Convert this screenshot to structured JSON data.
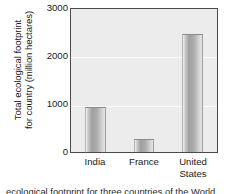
{
  "chart_data": {
    "type": "bar",
    "title": "",
    "xlabel": "",
    "ylabel": "Total ecological footprint for country (million hectares)",
    "ylabel_lines": [
      "Total ecological footprint",
      "for country (million hectares)"
    ],
    "categories": [
      "India",
      "France",
      "United States"
    ],
    "category_lines": [
      [
        "India"
      ],
      [
        "France"
      ],
      [
        "United",
        "States"
      ]
    ],
    "values": [
      950,
      270,
      2470
    ],
    "ylim": [
      0,
      3000
    ],
    "yticks": [
      0,
      1000,
      2000,
      3000
    ],
    "ytick_labels": [
      "0",
      "1000",
      "2000",
      "3000"
    ],
    "grid": true,
    "legend": null,
    "bar_color": "#a8a8a8",
    "plot_background": "#ececec",
    "axis_color": "#4a4a4a"
  },
  "caption": {
    "text": "ecological footprint for three countries of the World."
  }
}
